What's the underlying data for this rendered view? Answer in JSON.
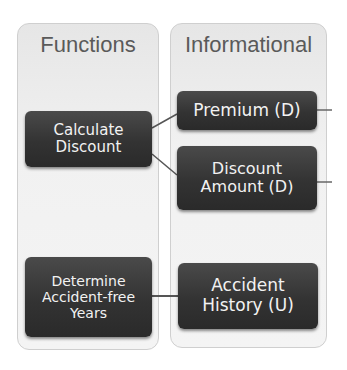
{
  "diagram": {
    "panels": [
      {
        "id": "functions",
        "title": "Functions"
      },
      {
        "id": "informational",
        "title": "Informational"
      }
    ],
    "nodes": {
      "calculate_discount": "Calculate\nDiscount",
      "determine_years": "Determine\nAccident-free\nYears",
      "premium": "Premium (D)",
      "discount_amount": "Discount\nAmount (D)",
      "accident_history": "Accident\nHistory (U)"
    },
    "connections": [
      {
        "from": "Calculate Discount",
        "to": "Premium (D)"
      },
      {
        "from": "Calculate Discount",
        "to": "Discount Amount (D)"
      },
      {
        "from": "Determine Accident-free Years",
        "to": "Accident History (U)"
      },
      {
        "from": "Premium (D)",
        "to": "offscreen-right"
      },
      {
        "from": "Discount Amount (D)",
        "to": "offscreen-right"
      }
    ],
    "colors": {
      "panel_bg": "#f0f0f0",
      "panel_border": "#cfcfcf",
      "node_bg": "#363636",
      "node_text": "#f2f2f2",
      "title_text": "#5a5a5a",
      "connector": "#555555"
    }
  }
}
